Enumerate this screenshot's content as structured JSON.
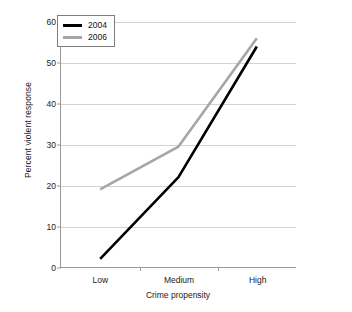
{
  "chart_data": {
    "type": "line",
    "title": "",
    "xlabel": "Crime propensity",
    "ylabel": "Percent violent response",
    "categories": [
      "Low",
      "Medium",
      "High"
    ],
    "ylim": [
      0,
      60
    ],
    "yticks": [
      0,
      10,
      20,
      30,
      40,
      50,
      60
    ],
    "grid": true,
    "legend_position": "top-left",
    "series": [
      {
        "name": "2004",
        "color": "#000000",
        "values": [
          2,
          22,
          54
        ]
      },
      {
        "name": "2006",
        "color": "#a6a6a6",
        "values": [
          19,
          29.5,
          56
        ]
      }
    ]
  },
  "axis": {
    "ytick_labels": [
      "0",
      "10",
      "20",
      "30",
      "40",
      "50",
      "60"
    ],
    "xtick_labels": [
      "Low",
      "Medium",
      "High"
    ],
    "x_title": "Crime propensity",
    "y_title": "Percent violent response"
  },
  "legend": {
    "entries": [
      {
        "label": "2004",
        "color": "#000000"
      },
      {
        "label": "2006",
        "color": "#a6a6a6"
      }
    ]
  }
}
